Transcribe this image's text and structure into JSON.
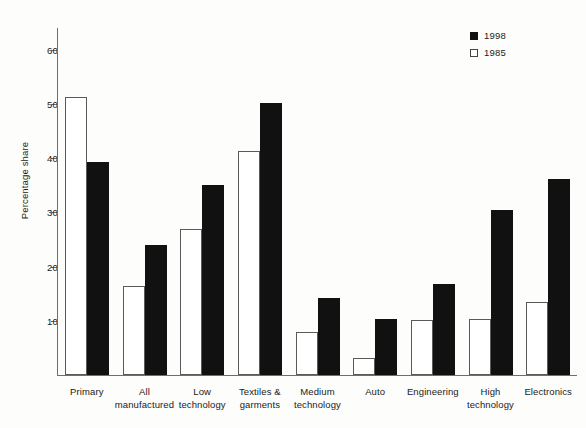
{
  "chart_data": {
    "type": "bar",
    "title": "",
    "xlabel": "",
    "ylabel": "Percentage share",
    "ylim": [
      0,
      64
    ],
    "yticks": [
      10,
      20,
      30,
      40,
      50,
      60
    ],
    "grid": false,
    "legend_position": "top-right",
    "categories": [
      "Primary",
      "All manufactured",
      "Low technology",
      "Textiles & garments",
      "Medium technology",
      "Auto",
      "Engineering",
      "High technology",
      "Electronics"
    ],
    "category_lines": [
      [
        "Primary"
      ],
      [
        "All",
        "manufactured"
      ],
      [
        "Low",
        "technology"
      ],
      [
        "Textiles &",
        "garments"
      ],
      [
        "Medium",
        "technology"
      ],
      [
        "Auto"
      ],
      [
        "Engineering"
      ],
      [
        "High",
        "technology"
      ],
      [
        "Electronics"
      ]
    ],
    "series": [
      {
        "name": "1985",
        "color": "#ffffff",
        "values": [
          51.3,
          16.4,
          27.0,
          41.4,
          8.0,
          3.2,
          10.2,
          10.3,
          13.5
        ]
      },
      {
        "name": "1998",
        "color": "#111111",
        "values": [
          39.2,
          24.0,
          35.0,
          50.1,
          14.2,
          10.3,
          16.7,
          30.4,
          36.2
        ]
      }
    ]
  },
  "legend": {
    "entries": [
      {
        "label": "1998",
        "swatch": "dark"
      },
      {
        "label": "1985",
        "swatch": "light"
      }
    ]
  },
  "axis": {
    "y_title": "Percentage share",
    "y_tick_labels": [
      "60",
      "50",
      "40",
      "30",
      "20",
      "10"
    ]
  },
  "colors": {
    "series_1998": "#111111",
    "series_1985": "#ffffff",
    "axis": "#6e6e6e",
    "text": "#1b1b1b",
    "background": "#fdfdfc"
  }
}
